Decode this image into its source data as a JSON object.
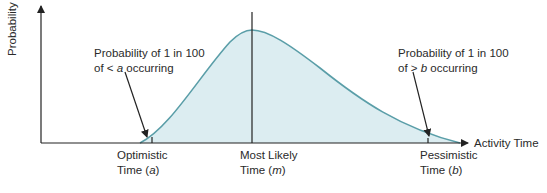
{
  "diagram": {
    "type": "beta-distribution-pert",
    "y_axis_label": "Probability",
    "x_axis_label": "Activity Time",
    "colors": {
      "curve": "#5a9ea8",
      "fill": "#dcedf1",
      "axis": "#222222"
    },
    "markers": [
      {
        "line1": "Optimistic",
        "line2_prefix": "Time (",
        "var": "a",
        "line2_suffix": ")"
      },
      {
        "line1": "Most Likely",
        "line2_prefix": "Time (",
        "var": "m",
        "line2_suffix": ")"
      },
      {
        "line1": "Pessimistic",
        "line2_prefix": "Time (",
        "var": "b",
        "line2_suffix": ")"
      }
    ],
    "annotations": [
      {
        "line1": "Probability of 1 in 100",
        "line2_prefix": "of < ",
        "var": "a",
        "line2_suffix": " occurring"
      },
      {
        "line1": "Probability of 1 in 100",
        "line2_prefix": "of > ",
        "var": "b",
        "line2_suffix": " occurring"
      }
    ]
  }
}
